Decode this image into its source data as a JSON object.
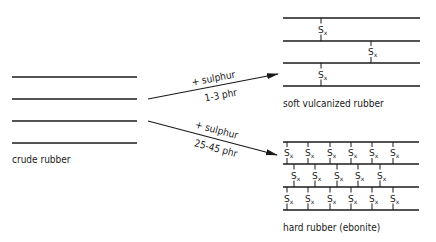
{
  "diagram": {
    "crude": {
      "label": "crude rubber",
      "chains_y": [
        77,
        99,
        121,
        143
      ],
      "x1": 12,
      "x2": 137,
      "label_pos": [
        12,
        163
      ]
    },
    "arrow_soft": {
      "from": [
        148,
        99
      ],
      "to": [
        278,
        74
      ],
      "label_top": "+ sulphur",
      "label_bottom": "1-3 phr"
    },
    "arrow_hard": {
      "from": [
        148,
        121
      ],
      "to": [
        277,
        155
      ],
      "label_top": "+ sulphur",
      "label_bottom": "25-45 phr"
    },
    "soft": {
      "label": "soft vulcanized rubber",
      "chains_y": [
        18,
        41,
        63,
        86
      ],
      "x1": 283,
      "x2": 420,
      "crosslinks": [
        {
          "x": 321,
          "row": 0
        },
        {
          "x": 371,
          "row": 1
        },
        {
          "x": 321,
          "row": 2
        }
      ],
      "label_pos": [
        283,
        107
      ]
    },
    "hard": {
      "label": "hard rubber (ebonite)",
      "chains_y": [
        142,
        164,
        187,
        210
      ],
      "x1": 283,
      "x2": 419,
      "rows": [
        [
          287,
          308,
          330,
          351,
          372,
          393
        ],
        [
          294,
          315,
          337,
          358,
          380
        ],
        [
          287,
          308,
          330,
          351,
          372,
          393
        ]
      ],
      "label_pos": [
        283,
        231
      ]
    },
    "crosslink_label": "S",
    "crosslink_sub": "x"
  }
}
